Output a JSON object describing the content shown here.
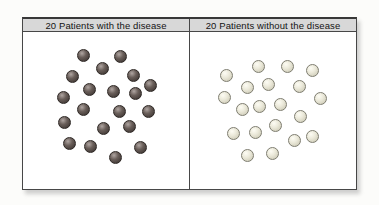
{
  "figure": {
    "panels": [
      {
        "id": "with-disease",
        "header": "20 Patients with the disease",
        "patient_count": 20,
        "dot_highlight": "#b0a6a2",
        "dot_color": "#6a5f5a",
        "dot_edge": "#332c29",
        "dot_border": "#2e2825",
        "dots": [
          [
            61,
            38
          ],
          [
            98,
            39
          ],
          [
            80,
            51
          ],
          [
            111,
            58
          ],
          [
            50,
            59
          ],
          [
            128,
            68
          ],
          [
            67,
            72
          ],
          [
            91,
            74
          ],
          [
            113,
            76
          ],
          [
            41,
            80
          ],
          [
            61,
            92
          ],
          [
            97,
            94
          ],
          [
            126,
            94
          ],
          [
            42,
            105
          ],
          [
            107,
            109
          ],
          [
            81,
            111
          ],
          [
            47,
            126
          ],
          [
            68,
            129
          ],
          [
            118,
            130
          ],
          [
            93,
            140
          ]
        ]
      },
      {
        "id": "without-disease",
        "header": "20 Patients without the disease",
        "patient_count": 20,
        "dot_highlight": "#fdfcf4",
        "dot_color": "#eceadb",
        "dot_edge": "#c6c3ae",
        "dot_border": "#7e7d70",
        "dots": [
          [
            236,
            49
          ],
          [
            265,
            49
          ],
          [
            290,
            53
          ],
          [
            204,
            58
          ],
          [
            246,
            67
          ],
          [
            225,
            70
          ],
          [
            277,
            69
          ],
          [
            298,
            81
          ],
          [
            202,
            80
          ],
          [
            258,
            87
          ],
          [
            237,
            89
          ],
          [
            220,
            92
          ],
          [
            278,
            99
          ],
          [
            253,
            108
          ],
          [
            233,
            115
          ],
          [
            211,
            116
          ],
          [
            290,
            119
          ],
          [
            272,
            123
          ],
          [
            225,
            138
          ],
          [
            250,
            136
          ]
        ]
      }
    ],
    "style_colors": {
      "header_bg": "#d8d8d8",
      "border": "#474747",
      "page_bg": "#fcfcfa"
    }
  }
}
